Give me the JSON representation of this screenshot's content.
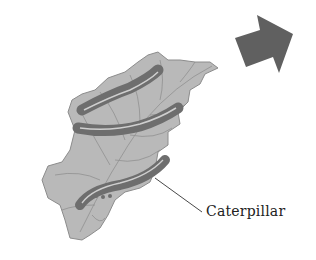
{
  "diagram": {
    "labels": {
      "caterpillar": "Caterpillar"
    },
    "elements": {
      "leaf": "leaf-illustration",
      "caterpillars_count": 3,
      "arrow": "arrow-right-icon"
    },
    "colors": {
      "background": "#ffffff",
      "leaf_fill": "#b8b8b8",
      "leaf_vein": "#8a8a8a",
      "caterpillar_body": "#6e6e6e",
      "caterpillar_stripe": "#d0d0d0",
      "arrow_fill": "#606060",
      "leader_line": "#333333",
      "text": "#222222"
    }
  }
}
